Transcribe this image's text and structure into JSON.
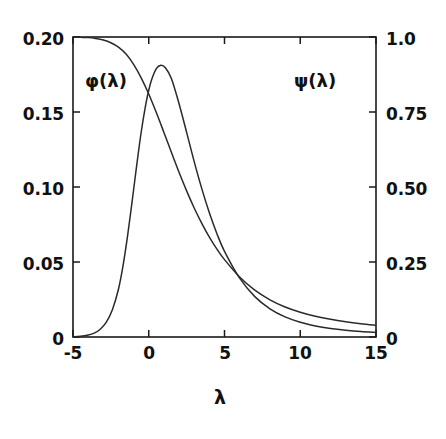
{
  "chart_data": {
    "type": "line",
    "title": "",
    "xlabel": "λ",
    "ylabel_left": "φ(λ)",
    "ylabel_right": "ψ(λ)",
    "grid": false,
    "legend_position": "inline-annotation",
    "xlim": [
      -5,
      15
    ],
    "ylim_left": [
      0,
      0.2
    ],
    "ylim_right": [
      0,
      1.0
    ],
    "xticks": [
      -5,
      0,
      5,
      10,
      15
    ],
    "xticklabels": [
      "-5",
      "0",
      "5",
      "10",
      "15"
    ],
    "yticks_left": [
      0,
      0.05,
      0.1,
      0.15,
      0.2
    ],
    "yticklabels_left": [
      "0",
      "0.05",
      "0.10",
      "0.15",
      "0.20"
    ],
    "yticks_right": [
      0,
      0.25,
      0.5,
      0.75,
      1.0
    ],
    "yticklabels_right": [
      "0",
      "0.25",
      "0.50",
      "0.75",
      "1.0"
    ],
    "annotations": [
      {
        "text": "φ(λ)",
        "x_px": 107,
        "y_px": 82
      },
      {
        "text": "ψ(λ)",
        "x_px": 316,
        "y_px": 82
      }
    ],
    "series": [
      {
        "name": "φ(λ)",
        "axis": "left",
        "x": [
          -5,
          -4.5,
          -4,
          -3.6,
          -3.2,
          -2.8,
          -2.4,
          -2,
          -1.7,
          -1.4,
          -1.1,
          -0.8,
          -0.5,
          -0.2,
          0,
          0.2,
          0.5,
          0.8,
          1.1,
          1.5,
          2,
          2.5,
          3,
          3.5,
          4,
          4.5,
          5,
          6,
          7,
          8,
          9,
          10,
          11,
          12,
          13,
          14,
          15
        ],
        "y": [
          0.0002,
          0.0005,
          0.0013,
          0.0026,
          0.0052,
          0.0099,
          0.0182,
          0.0318,
          0.0474,
          0.0672,
          0.0902,
          0.1141,
          0.1365,
          0.1549,
          0.1645,
          0.1718,
          0.1789,
          0.1812,
          0.1795,
          0.1722,
          0.1555,
          0.1364,
          0.1169,
          0.0989,
          0.0828,
          0.0689,
          0.0571,
          0.0392,
          0.0269,
          0.0188,
          0.0134,
          0.0098,
          0.0074,
          0.0057,
          0.0045,
          0.0036,
          0.003
        ]
      },
      {
        "name": "ψ(λ)",
        "axis": "right",
        "x": [
          -5,
          -4.5,
          -4,
          -3.5,
          -3,
          -2.5,
          -2,
          -1.5,
          -1,
          -0.5,
          0,
          0.5,
          1,
          1.5,
          2,
          2.5,
          3,
          3.5,
          4,
          4.5,
          5,
          6,
          7,
          8,
          9,
          10,
          11,
          12,
          13,
          14,
          15
        ],
        "y": [
          1.0,
          0.999,
          0.998,
          0.995,
          0.99,
          0.981,
          0.966,
          0.943,
          0.909,
          0.864,
          0.81,
          0.748,
          0.682,
          0.615,
          0.549,
          0.487,
          0.43,
          0.379,
          0.333,
          0.293,
          0.258,
          0.2,
          0.156,
          0.124,
          0.1,
          0.0825,
          0.0692,
          0.0589,
          0.0508,
          0.0443,
          0.039
        ]
      }
    ],
    "notes": {
      "crossing_point": {
        "lambda": 4.2,
        "phi": 0.057,
        "psi": 0.285
      },
      "phi_peak": {
        "lambda": 0.6,
        "value": 0.181
      }
    }
  },
  "colors": {
    "background": "#ffffff",
    "axis": "#1a1a1a",
    "curve": "#2a2a2a",
    "text": "#111111"
  },
  "geometry": {
    "plot_left": 73,
    "plot_right": 376,
    "plot_top": 37,
    "plot_bottom": 337
  }
}
